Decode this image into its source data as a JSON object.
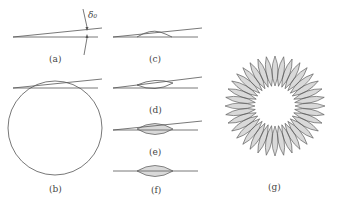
{
  "figure": {
    "panels": [
      {
        "id": "a",
        "label": "(a)",
        "annotation": "δ₀",
        "description": "two lines meeting at small angle with thickness marker"
      },
      {
        "id": "b",
        "label": "(b)",
        "description": "circle tangent to wedge lines"
      },
      {
        "id": "c",
        "label": "(c)",
        "description": "wedge with small bump"
      },
      {
        "id": "d",
        "label": "(d)",
        "description": "lens-shaped outline between lines"
      },
      {
        "id": "e",
        "label": "(e)",
        "description": "hatched lens between diverging lines"
      },
      {
        "id": "f",
        "label": "(f)",
        "description": "hatched lens on single line"
      },
      {
        "id": "g",
        "label": "(g)",
        "description": "rosette of hatched lens petals",
        "petal_count": 36
      }
    ],
    "colors": {
      "stroke": "#555555",
      "background": "#ffffff"
    }
  }
}
